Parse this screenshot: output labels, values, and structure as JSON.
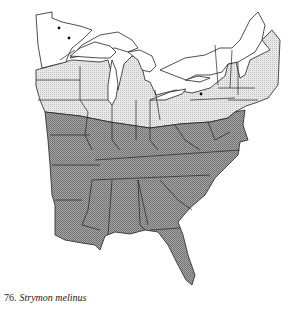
{
  "figure": {
    "number": "76.",
    "species": "Strymon melinus"
  },
  "legend": {
    "zones": [
      {
        "name": "resident",
        "fill": "#8f8f8f"
      },
      {
        "name": "stray-or-migrant",
        "fill": "#d9d9d9"
      },
      {
        "name": "absent",
        "fill": "#ffffff"
      }
    ],
    "record_markers": 3
  },
  "colors": {
    "outline": "#222222",
    "dark_zone": "#8f8f8f",
    "light_zone": "#d9d9d9"
  }
}
